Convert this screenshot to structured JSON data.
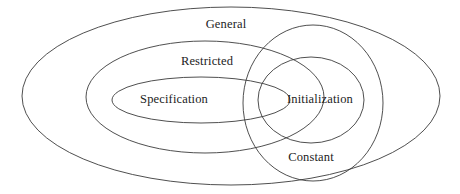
{
  "diagram": {
    "type": "venn-euler",
    "title": "",
    "width": 460,
    "height": 194,
    "background_color": "#ffffff",
    "stroke_color": "#3b3b3b",
    "text_color": "#1c1c1c",
    "sets": [
      {
        "key": "general",
        "label": "General",
        "label_x": 226,
        "label_y": 24,
        "cx": 231,
        "cy": 96,
        "rx": 209,
        "ry": 89
      },
      {
        "key": "restricted",
        "label": "Restricted",
        "label_x": 207,
        "label_y": 61,
        "cx": 205,
        "cy": 97,
        "rx": 119,
        "ry": 56
      },
      {
        "key": "specification",
        "label": "Specification",
        "label_x": 174,
        "label_y": 99,
        "cx": 201,
        "cy": 100,
        "rx": 89,
        "ry": 23
      },
      {
        "key": "constant",
        "label": "Constant",
        "label_x": 311,
        "label_y": 157,
        "cx": 313,
        "cy": 103,
        "rx": 70,
        "ry": 78
      },
      {
        "key": "initialization",
        "label": "Initialization",
        "label_x": 320,
        "label_y": 99,
        "cx": 311,
        "cy": 100,
        "rx": 53,
        "ry": 43
      }
    ]
  }
}
